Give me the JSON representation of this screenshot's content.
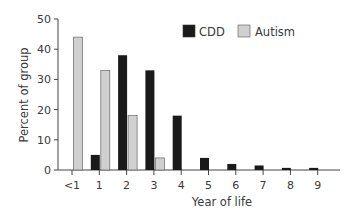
{
  "chart_data": {
    "type": "bar",
    "title": "",
    "xlabel": "Year of life",
    "ylabel": "Percent of group",
    "categories": [
      "<1",
      "1",
      "2",
      "3",
      "4",
      "5",
      "6",
      "7",
      "8",
      "9"
    ],
    "series": [
      {
        "name": "CDD",
        "color": "#1a1a1a",
        "values": [
          0,
          5,
          38,
          33,
          18,
          4,
          2,
          1.5,
          0.7,
          0.7
        ]
      },
      {
        "name": "Autism",
        "color": "#d0d0d0",
        "values": [
          44,
          33,
          18,
          4,
          0,
          0,
          0,
          0,
          0,
          0
        ]
      }
    ],
    "ylim": [
      0,
      50
    ],
    "yticks": [
      0,
      10,
      20,
      30,
      40,
      50
    ],
    "grid": false,
    "legend_position": "top-right"
  }
}
